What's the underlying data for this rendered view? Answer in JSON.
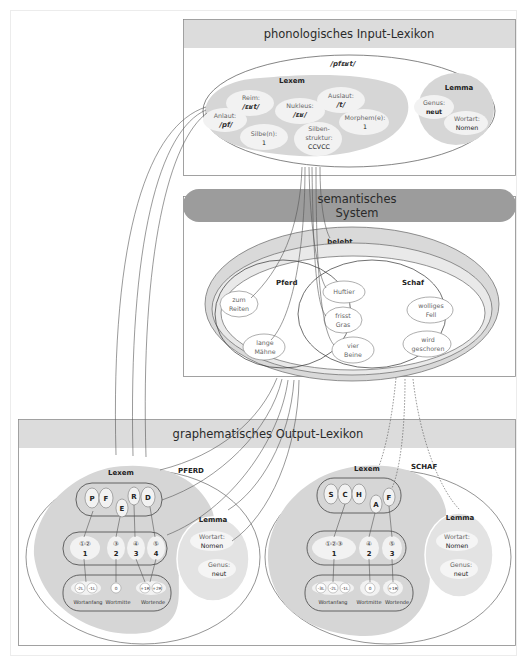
{
  "colors": {
    "header_band": "#dcdcdc",
    "semantic_band": "#9c9c9c",
    "lexem_fill": "#d6d6d6",
    "lemma_fill": "#dadada",
    "bubble_fill": "#f2f2f2",
    "box_border": "#8a8a8a",
    "outer_frame": "#ececec"
  },
  "phonological_input": {
    "title": "phonologisches Input-Lexikon",
    "word": "/pfɛʁt/",
    "lexem": {
      "label": "Lexem",
      "items": [
        {
          "label": "Reim:",
          "value": "/ɛʁt/"
        },
        {
          "label": "Auslaut:",
          "value": "/t/"
        },
        {
          "label": "Nukleus:",
          "value": "/ɛʁ/"
        },
        {
          "label": "Anlaut:",
          "value": "/pf/"
        },
        {
          "label": "Morphem(e):",
          "value": "1"
        },
        {
          "label": "Silbe(n):",
          "value": "1"
        },
        {
          "label_line1": "Silben-",
          "label_line2": "struktur:",
          "value": "CCVCC"
        }
      ]
    },
    "lemma": {
      "label": "Lemma",
      "items": [
        {
          "label": "Genus:",
          "value": "neut"
        },
        {
          "label": "Wortart:",
          "value": "Nomen"
        }
      ]
    }
  },
  "semantic_system": {
    "title_line1": "semantisches",
    "title_line2": "System",
    "belebt": "belebt",
    "saeugetier": "Säugetier",
    "pferd": {
      "label": "Pferd",
      "features": [
        {
          "line1": "zum",
          "line2": "Reiten"
        },
        {
          "line1": "lange",
          "line2": "Mähne"
        }
      ]
    },
    "shared": [
      {
        "line1": "Huftier",
        "line2": ""
      },
      {
        "line1": "frisst",
        "line2": "Gras"
      },
      {
        "line1": "vier",
        "line2": "Beine"
      }
    ],
    "schaf": {
      "label": "Schaf",
      "features": [
        {
          "line1": "wolliges",
          "line2": "Fell"
        },
        {
          "line1": "wird",
          "line2": "geschoren"
        }
      ]
    }
  },
  "graphematic_output": {
    "title": "graphematisches Output-Lexikon",
    "pferd": {
      "word": "PFERD",
      "lexem_label": "Lexem",
      "letters": [
        "P",
        "F",
        "E",
        "R",
        "D"
      ],
      "graphemes": [
        "①②",
        "③",
        "④",
        "⑤"
      ],
      "grapheme_numbers": [
        "1",
        "2",
        "3",
        "4"
      ],
      "positions": [
        "-2L",
        "-1L",
        "0",
        "+1R",
        "+2R"
      ],
      "zones": [
        "Wortanfang",
        "Wortmitte",
        "Wortende"
      ],
      "lemma": {
        "label": "Lemma",
        "items": [
          {
            "label": "Wortart:",
            "value": "Nomen"
          },
          {
            "label": "Genus:",
            "value": "neut"
          }
        ]
      }
    },
    "schaf": {
      "word": "SCHAF",
      "lexem_label": "Lexem",
      "letters": [
        "S",
        "C",
        "H",
        "A",
        "F"
      ],
      "graphemes": [
        "①②③",
        "④",
        "⑤"
      ],
      "grapheme_numbers": [
        "1",
        "2",
        "3"
      ],
      "positions": [
        "-3L",
        "-2L",
        "-1L",
        "0",
        "+1R"
      ],
      "zones": [
        "Wortanfang",
        "Wortmitte",
        "Wortende"
      ],
      "lemma": {
        "label": "Lemma",
        "items": [
          {
            "label": "Wortart:",
            "value": "Nomen"
          },
          {
            "label": "Genus:",
            "value": "neut"
          }
        ]
      }
    }
  }
}
